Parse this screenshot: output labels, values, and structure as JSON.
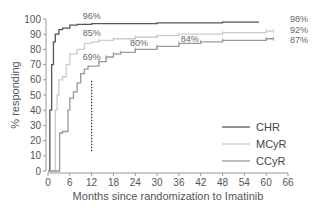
{
  "chart_data": {
    "type": "line",
    "title": "",
    "xlabel": "Months since randomization to Imatinib",
    "ylabel": "% responding",
    "xlim": [
      0,
      66
    ],
    "ylim": [
      0,
      100
    ],
    "xticks": [
      0,
      6,
      12,
      18,
      24,
      30,
      36,
      42,
      48,
      54,
      60,
      66
    ],
    "yticks": [
      0,
      10,
      20,
      30,
      40,
      50,
      60,
      70,
      80,
      90,
      100
    ],
    "grid": false,
    "legend_position": "lower right",
    "series": [
      {
        "name": "CHR",
        "color": "#555555",
        "x": [
          0,
          0.5,
          1,
          1.5,
          2,
          3,
          4,
          6,
          8,
          12,
          20,
          30,
          48,
          58
        ],
        "y": [
          0,
          40,
          70,
          85,
          90,
          93,
          94,
          96,
          96.5,
          97,
          97,
          97.5,
          98,
          98
        ]
      },
      {
        "name": "MCyR",
        "color": "#cccccc",
        "x": [
          0,
          1,
          2,
          2.5,
          3,
          4,
          5,
          6,
          8,
          10,
          12,
          14,
          18,
          24,
          30,
          36,
          48,
          60,
          62
        ],
        "y": [
          0,
          0,
          40,
          50,
          60,
          62,
          70,
          77,
          80,
          84,
          85,
          86,
          87,
          88,
          89,
          90,
          91,
          92,
          92
        ]
      },
      {
        "name": "CCyR",
        "color": "#999999",
        "x": [
          0,
          3,
          3.2,
          4,
          5,
          5.5,
          6,
          7,
          8,
          9,
          10,
          11,
          12,
          14,
          16,
          18,
          20,
          24,
          30,
          36,
          42,
          48,
          60,
          62
        ],
        "y": [
          0,
          0,
          25,
          26,
          26,
          40,
          48,
          52,
          58,
          64,
          67,
          69,
          69,
          72,
          75,
          77,
          78,
          80,
          82,
          84,
          85,
          86,
          87,
          87
        ]
      }
    ],
    "annotations": [
      {
        "text": "96%",
        "x": 12,
        "y": 100
      },
      {
        "text": "85%",
        "x": 12,
        "y": 89
      },
      {
        "text": "69%",
        "x": 12,
        "y": 73
      },
      {
        "text": "80%",
        "x": 25,
        "y": 82
      },
      {
        "text": "84%",
        "x": 39,
        "y": 85
      },
      {
        "text": "98%",
        "x": 69,
        "y": 98
      },
      {
        "text": "92%",
        "x": 69,
        "y": 91
      },
      {
        "text": "87%",
        "x": 69,
        "y": 84
      }
    ],
    "reference_line": {
      "x": 12,
      "y_from": 13,
      "y_to": 60,
      "style": "dotted"
    }
  },
  "legend": {
    "items": [
      {
        "label": "CHR",
        "color": "#555555"
      },
      {
        "label": "MCyR",
        "color": "#cccccc"
      },
      {
        "label": "CCyR",
        "color": "#999999"
      }
    ]
  }
}
